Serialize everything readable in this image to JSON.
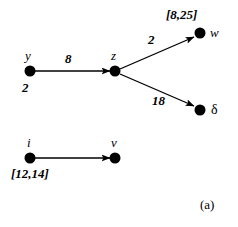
{
  "figure": {
    "caption": "(a)",
    "background_color": "#ffffff",
    "ink_color": "#000000",
    "node_radius": 5
  },
  "nodes": [
    {
      "id": "y",
      "label": "y",
      "x": 30,
      "y": 71,
      "label_dx": -5,
      "label_dy": -22
    },
    {
      "id": "z",
      "label": "z",
      "x": 115,
      "y": 71,
      "label_dx": -4,
      "label_dy": -22
    },
    {
      "id": "w",
      "label": "w",
      "x": 200,
      "y": 33,
      "label_dx": 10,
      "label_dy": -7
    },
    {
      "id": "delta",
      "label": "δ",
      "x": 200,
      "y": 110,
      "label_dx": 11,
      "label_dy": -6
    },
    {
      "id": "i",
      "label": "i",
      "x": 30,
      "y": 158,
      "label_dx": -3,
      "label_dy": -22
    },
    {
      "id": "v",
      "label": "v",
      "x": 115,
      "y": 158,
      "label_dx": -4,
      "label_dy": -22
    }
  ],
  "edges": [
    {
      "from": "y",
      "to": "z",
      "weight": "8",
      "label_x": 65,
      "label_y": 57
    },
    {
      "from": "z",
      "to": "w",
      "weight": "2",
      "label_x": 148,
      "label_y": 38
    },
    {
      "from": "z",
      "to": "delta",
      "weight": "18",
      "label_x": 152,
      "label_y": 99
    },
    {
      "from": "i",
      "to": "v",
      "weight": "",
      "label_x": 0,
      "label_y": 0
    }
  ],
  "annotations": [
    {
      "id": "w-interval",
      "text": "[8,25]",
      "x": 166,
      "y": 11,
      "kind": "interval"
    },
    {
      "id": "y-value",
      "text": "2",
      "x": 22,
      "y": 84,
      "kind": "value"
    },
    {
      "id": "iv-interval",
      "text": "[12,14]",
      "x": 11,
      "y": 170,
      "kind": "interval"
    }
  ]
}
